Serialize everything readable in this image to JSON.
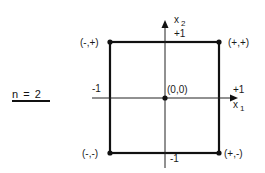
{
  "diagram": {
    "title_label": "n = 2",
    "axes": {
      "x_axis_label": "x",
      "x_axis_subscript": "1",
      "y_axis_label": "x",
      "y_axis_subscript": "2",
      "x_pos_tick": "+1",
      "x_neg_tick": "-1",
      "y_pos_tick": "+1",
      "y_neg_tick": "-1"
    },
    "points": {
      "center": "(0,0)",
      "top_left": "(-,+)",
      "top_right": "(+,+)",
      "bottom_left": "(-,-)",
      "bottom_right": "(+,-)"
    },
    "colors": {
      "line": "#111111",
      "background": "#ffffff"
    }
  }
}
